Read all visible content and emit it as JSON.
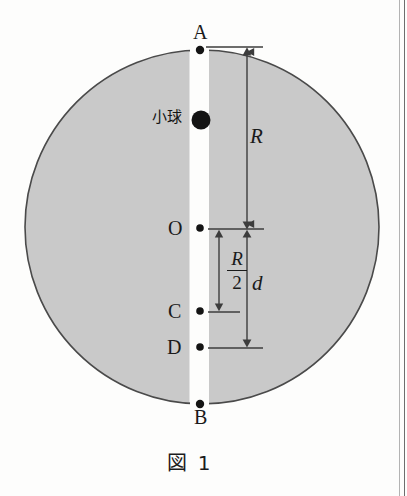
{
  "figure": {
    "caption": "図 1",
    "points": {
      "A": "A",
      "B": "B",
      "O": "O",
      "C": "C",
      "D": "D"
    },
    "annotations": {
      "ball_label": "小球",
      "radius_label": "R",
      "distance_label": "d",
      "half_radius_numerator": "R",
      "half_radius_denominator": "2"
    },
    "colors": {
      "disk_fill": "#c9c9c9",
      "disk_stroke": "#4a4a4a",
      "slot_fill": "#fdfdfc",
      "ink": "#1a1a1a",
      "dimension_line": "#3c3c3c",
      "page_rule": "#9a9a9a"
    },
    "geometry": {
      "circle_center_x": 202,
      "circle_center_y": 227,
      "circle_radius": 177,
      "slot_left_x": 190,
      "slot_right_x": 209,
      "axis_x": 200,
      "point_A_y": 50,
      "point_ball_y": 120,
      "point_O_y": 228,
      "point_C_y": 311,
      "point_D_y": 347,
      "point_B_y": 404
    }
  }
}
